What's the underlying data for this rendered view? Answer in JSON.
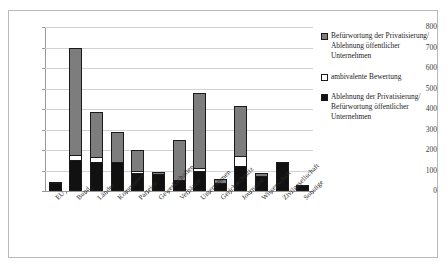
{
  "chart_data": {
    "type": "bar",
    "stacked": true,
    "title": "",
    "subtitle": "",
    "xlabel": "",
    "ylabel": "",
    "ylim": [
      0,
      800
    ],
    "yticks": [
      0,
      100,
      200,
      300,
      400,
      500,
      600,
      700,
      800
    ],
    "grid": true,
    "legend_position": "right",
    "categories": [
      "EU",
      "Bund",
      "Länder",
      "Kommunen",
      "Parteien",
      "Gewerkschaften",
      "Verbände",
      "Unternehmen",
      "Gerichte/Justiz",
      "Journalist",
      "Wissenschaft",
      "Zivilgesellschaft",
      "Sonstige"
    ],
    "series": [
      {
        "name": "Ablehnung der Privatisierung/ Befürwortung öffentlicher Unternehmen",
        "color": "#111111",
        "values": [
          40,
          150,
          140,
          140,
          90,
          85,
          55,
          100,
          40,
          120,
          75,
          140,
          30
        ]
      },
      {
        "name": "ambivalente Bewertung",
        "color": "#ffffff",
        "values": [
          0,
          25,
          25,
          0,
          10,
          0,
          0,
          10,
          0,
          50,
          0,
          0,
          0
        ]
      },
      {
        "name": "Befürwortung der Privatisierung/ Ablehnung öffentlicher Unternehmen",
        "color": "#7d7d7d",
        "values": [
          5,
          525,
          220,
          150,
          100,
          10,
          195,
          370,
          20,
          245,
          15,
          0,
          0
        ]
      }
    ],
    "totals": [
      45,
      700,
      385,
      290,
      200,
      95,
      250,
      480,
      60,
      415,
      90,
      140,
      30
    ]
  },
  "legend": {
    "entries": [
      {
        "swatch": "grey",
        "label": "Befürwortung der Privatisierung/ Ablehnung öffentlicher Unternehmen"
      },
      {
        "swatch": "white",
        "label": "ambivalente Bewertung"
      },
      {
        "swatch": "black",
        "label": "Ablehnung der Privatisierung/ Befürwortung öffentlicher Unternehmen"
      }
    ]
  }
}
